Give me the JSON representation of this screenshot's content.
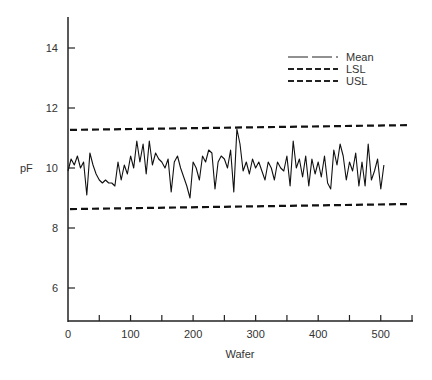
{
  "chart_data": {
    "type": "line",
    "title": "",
    "xlabel": "Wafer",
    "ylabel": "pF",
    "xlim": [
      0,
      550
    ],
    "ylim": [
      5,
      15
    ],
    "x_ticks": [
      0,
      100,
      200,
      300,
      400,
      500
    ],
    "x_tick_labels": [
      "0",
      "100",
      "200",
      "300",
      "400",
      "500"
    ],
    "x_minor_ticks": [
      50,
      150,
      250,
      350,
      450,
      550
    ],
    "y_ticks": [
      6,
      8,
      10,
      12,
      14
    ],
    "y_tick_labels": [
      "6",
      "8",
      "10",
      "12",
      "14"
    ],
    "grid": false,
    "legend_position": "upper right",
    "legend": [
      {
        "label": "Mean",
        "style": "long-dash"
      },
      {
        "label": "LSL",
        "style": "short-dash"
      },
      {
        "label": "USL",
        "style": "short-dash"
      }
    ],
    "series": [
      {
        "name": "Mean",
        "style": "solid",
        "x": [
          0,
          5,
          10,
          15,
          20,
          25,
          30,
          35,
          40,
          45,
          50,
          55,
          60,
          65,
          70,
          75,
          80,
          85,
          90,
          95,
          100,
          105,
          110,
          115,
          120,
          125,
          130,
          135,
          140,
          145,
          150,
          155,
          160,
          165,
          170,
          175,
          180,
          185,
          190,
          195,
          200,
          205,
          210,
          215,
          220,
          225,
          230,
          235,
          240,
          245,
          250,
          255,
          260,
          265,
          270,
          275,
          280,
          285,
          290,
          295,
          300,
          305,
          310,
          315,
          320,
          325,
          330,
          335,
          340,
          345,
          350,
          355,
          360,
          365,
          370,
          375,
          380,
          385,
          390,
          395,
          400,
          405,
          410,
          415,
          420,
          425,
          430,
          435,
          440,
          445,
          450,
          455,
          460,
          465,
          470,
          475,
          480,
          485,
          490,
          495,
          500,
          505
        ],
        "values": [
          9.9,
          10.3,
          10.1,
          10.4,
          10.0,
          10.2,
          9.1,
          10.5,
          10.1,
          9.8,
          9.6,
          9.5,
          9.6,
          9.5,
          9.5,
          9.4,
          10.2,
          9.6,
          10.1,
          9.8,
          10.4,
          10.0,
          10.9,
          10.2,
          10.8,
          9.8,
          10.9,
          10.1,
          10.5,
          10.3,
          10.2,
          10.0,
          10.3,
          9.2,
          10.2,
          10.4,
          10.0,
          9.7,
          9.4,
          9.0,
          10.2,
          10.0,
          9.6,
          10.4,
          10.2,
          10.6,
          10.5,
          9.3,
          10.2,
          10.4,
          10.3,
          10.0,
          10.6,
          9.2,
          11.3,
          10.8,
          9.9,
          10.2,
          9.8,
          10.3,
          10.0,
          10.2,
          9.9,
          9.6,
          10.2,
          10.0,
          9.6,
          10.2,
          10.0,
          9.9,
          10.4,
          9.4,
          10.9,
          10.0,
          10.3,
          9.7,
          10.4,
          9.4,
          10.3,
          9.8,
          10.2,
          9.7,
          10.4,
          9.5,
          9.3,
          10.6,
          10.1,
          10.8,
          10.4,
          9.6,
          10.2,
          9.9,
          10.5,
          9.4,
          10.2,
          9.4,
          10.8,
          9.6,
          9.9,
          10.3,
          9.3,
          10.1
        ]
      },
      {
        "name": "LSL",
        "style": "dashed",
        "x": [
          0,
          550
        ],
        "values": [
          8.63,
          8.8
        ]
      },
      {
        "name": "USL",
        "style": "dashed",
        "x": [
          0,
          550
        ],
        "values": [
          11.27,
          11.43
        ]
      }
    ]
  }
}
